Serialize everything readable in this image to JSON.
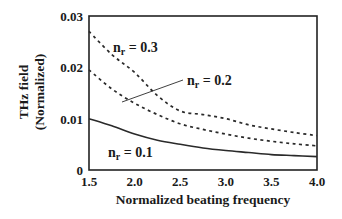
{
  "chart_data": {
    "type": "line",
    "title": "",
    "xlabel": "Normalized beating frequency",
    "ylabel_lines": [
      "THz field",
      "(Normalized)"
    ],
    "ylabel": "THz field (Normalized)",
    "xlim": [
      1.5,
      4.0
    ],
    "ylim": [
      0,
      0.03
    ],
    "xticks": [
      1.5,
      2.0,
      2.5,
      3.0,
      3.5,
      4.0
    ],
    "xtick_labels": [
      "1.5",
      "2.0",
      "2.5",
      "3.0",
      "3.5",
      "4.0"
    ],
    "yticks": [
      0,
      0.01,
      0.02,
      0.03
    ],
    "ytick_labels": [
      "0",
      "0.01",
      "0.02",
      "0.03"
    ],
    "grid": false,
    "legend": "none (inline annotations)",
    "x": [
      1.5,
      1.75,
      2.0,
      2.25,
      2.5,
      2.75,
      3.0,
      3.25,
      3.5,
      3.75,
      4.0
    ],
    "series": [
      {
        "name": "n_r = 0.3",
        "style": "dashed",
        "values": [
          0.027,
          0.0225,
          0.019,
          0.0145,
          0.0115,
          0.0108,
          0.01,
          0.0088,
          0.008,
          0.0073,
          0.0067
        ]
      },
      {
        "name": "n_r = 0.2",
        "style": "dashed",
        "values": [
          0.0195,
          0.0158,
          0.013,
          0.0108,
          0.009,
          0.0079,
          0.007,
          0.0062,
          0.0056,
          0.0051,
          0.0047
        ]
      },
      {
        "name": "n_r = 0.1",
        "style": "solid",
        "values": [
          0.01,
          0.0086,
          0.007,
          0.0058,
          0.005,
          0.0043,
          0.0038,
          0.0034,
          0.003,
          0.0028,
          0.0026
        ]
      }
    ],
    "annotations": [
      {
        "base": "n",
        "sub": "r",
        "text": " = 0.3",
        "x": 113,
        "y": 52,
        "series": 0
      },
      {
        "base": "n",
        "sub": "r",
        "text": " = 0.2",
        "x": 187,
        "y": 85,
        "series": 1,
        "leader": [
          [
            122,
            102
          ],
          [
            183,
            80
          ]
        ]
      },
      {
        "base": "n",
        "sub": "r",
        "text": " = 0.1",
        "x": 108,
        "y": 157,
        "series": 2
      }
    ]
  },
  "colors": {
    "axis": "#222222",
    "line": "#2a2a2a",
    "background": "#ffffff"
  }
}
